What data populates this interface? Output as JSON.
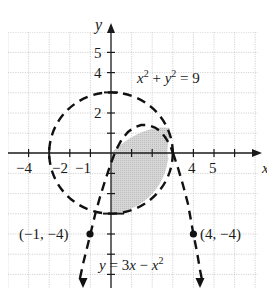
{
  "figure": {
    "axes": {
      "x_label": "x",
      "y_label": "y",
      "x_tick_labels": [
        "−4",
        "−2",
        "−1",
        "4",
        "5"
      ],
      "y_tick_labels": [
        "5",
        "4",
        "2"
      ],
      "x_range": [
        -5,
        7
      ],
      "y_range": [
        -6.5,
        6
      ]
    },
    "curves": [
      {
        "name": "circle",
        "equation": "x² + y² = 9",
        "style": "dashed",
        "label_parts": {
          "a": "x",
          "a_exp": "2",
          "plus": " + ",
          "b": "y",
          "b_exp": "2",
          "rhs": " = 9"
        }
      },
      {
        "name": "parabola",
        "equation": "y = 3x − x²",
        "style": "dashed",
        "label_parts": {
          "lhs": "y",
          "mid": " = 3",
          "x1": "x",
          "minus": " − ",
          "x2": "x",
          "exp": "2"
        }
      }
    ],
    "points": [
      {
        "label": "(−1, −4)",
        "x": -1,
        "y": -4
      },
      {
        "label": "(4, −4)",
        "x": 4,
        "y": -4
      }
    ],
    "shaded_region": "inside circle and below parabola: x² + y² < 9 and y < 3x − x²",
    "colors": {
      "grid": "#c8c8c8",
      "axis": "#1a1a1a",
      "curve": "#111111",
      "shade": "#cfcfcf",
      "background": "#ffffff"
    }
  }
}
